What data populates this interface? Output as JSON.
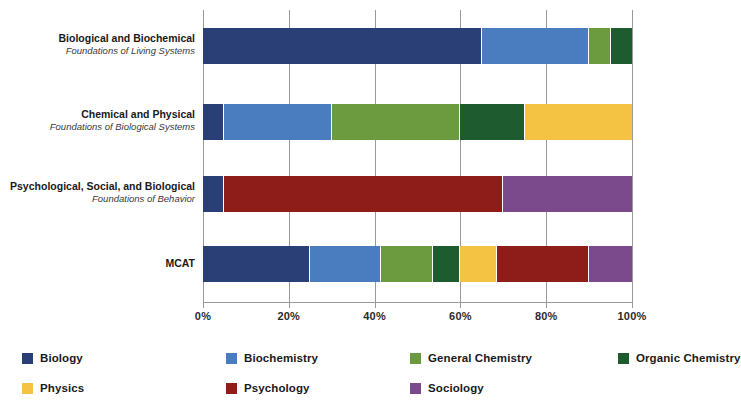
{
  "chart_data": {
    "type": "bar",
    "orientation": "horizontal",
    "stacked": true,
    "normalized_percent": true,
    "title": "",
    "subtitle": "",
    "xlabel": "",
    "ylabel": "",
    "xlim": [
      0,
      100
    ],
    "xticks": [
      0,
      20,
      40,
      60,
      80,
      100
    ],
    "xtick_labels": [
      "0%",
      "20%",
      "40%",
      "60%",
      "80%",
      "100%"
    ],
    "grid": "vertical",
    "legend_position": "bottom",
    "categories": [
      {
        "id": "bio-biochem",
        "label": "Biological and Biochemical",
        "sublabel": "Foundations of Living Systems"
      },
      {
        "id": "chem-phys",
        "label": "Chemical and Physical",
        "sublabel": "Foundations of Biological Systems"
      },
      {
        "id": "psych-soc-bio",
        "label": "Psychological, Social, and Biological",
        "sublabel": "Foundations of Behavior"
      },
      {
        "id": "mcat",
        "label": "MCAT",
        "sublabel": ""
      }
    ],
    "series": [
      {
        "name": "Biology",
        "color": "#2b3f77",
        "values": [
          65,
          5,
          5,
          25
        ]
      },
      {
        "name": "Biochemistry",
        "color": "#4a7cc0",
        "values": [
          25,
          25,
          0,
          16.5
        ]
      },
      {
        "name": "General Chemistry",
        "color": "#6c9b3f",
        "values": [
          5,
          30,
          0,
          12
        ]
      },
      {
        "name": "Organic Chemistry",
        "color": "#1e5b2e",
        "values": [
          5,
          15,
          0,
          6.5
        ]
      },
      {
        "name": "Physics",
        "color": "#f5c344",
        "values": [
          0,
          25,
          0,
          8.5
        ]
      },
      {
        "name": "Psychology",
        "color": "#8e1c18",
        "values": [
          0,
          0,
          65,
          21.5
        ]
      },
      {
        "name": "Sociology",
        "color": "#7b4a8c",
        "values": [
          0,
          0,
          30,
          10
        ]
      }
    ]
  },
  "legend": {
    "items": [
      {
        "label": "Biology",
        "color": "#2b3f77"
      },
      {
        "label": "Biochemistry",
        "color": "#4a7cc0"
      },
      {
        "label": "General Chemistry",
        "color": "#6c9b3f"
      },
      {
        "label": "Organic Chemistry",
        "color": "#1e5b2e"
      },
      {
        "label": "Physics",
        "color": "#f5c344"
      },
      {
        "label": "Psychology",
        "color": "#8e1c18"
      },
      {
        "label": "Sociology",
        "color": "#7b4a8c"
      }
    ]
  },
  "axis": {
    "grid_color": "#9a9a9a",
    "tick_color": "#9a9a9a"
  }
}
